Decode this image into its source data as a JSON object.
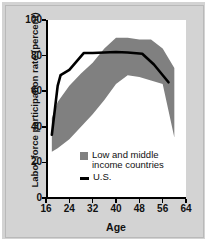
{
  "chart_data": {
    "type": "area",
    "title": "",
    "xlabel": "Age",
    "ylabel": "Labor force participation rate (percent)",
    "xlim": [
      16,
      64
    ],
    "ylim": [
      0,
      100
    ],
    "xticks": [
      16,
      24,
      32,
      40,
      48,
      56,
      64
    ],
    "yticks": [
      0,
      20,
      40,
      60,
      80,
      100
    ],
    "grid": false,
    "legend_position": "inside-lower-center",
    "series": [
      {
        "name": "Low and middle income countries",
        "type": "band",
        "color": "#808080",
        "x": [
          18,
          20,
          24,
          28,
          32,
          36,
          40,
          44,
          48,
          52,
          56,
          60
        ],
        "upper": [
          45,
          54,
          63,
          70,
          76,
          84,
          90,
          90,
          89,
          89,
          84,
          73
        ],
        "lower": [
          26,
          28,
          33,
          40,
          47,
          55,
          64,
          69,
          68,
          66,
          64,
          34
        ]
      },
      {
        "name": "U.S.",
        "type": "line",
        "color": "#000000",
        "x": [
          18,
          20,
          21,
          24,
          29,
          32,
          40,
          44,
          49,
          53,
          58
        ],
        "y": [
          35.5,
          63,
          69,
          72,
          81.5,
          81.5,
          82,
          81.7,
          81,
          75,
          65
        ]
      }
    ],
    "legend": [
      {
        "label": "Low and middle income countries",
        "marker": "square",
        "color": "#808080"
      },
      {
        "label": "U.S.",
        "marker": "line",
        "color": "#000000"
      }
    ]
  },
  "colors": {
    "background": "#d3d3d3",
    "plot_background": "#ffffff",
    "band": "#808080",
    "line": "#000000",
    "axis": "#000000"
  },
  "axis": {
    "y_tick_labels": [
      "100",
      "80",
      "60",
      "40",
      "20",
      "0"
    ],
    "x_tick_labels": [
      "16",
      "24",
      "32",
      "40",
      "48",
      "56",
      "64"
    ],
    "y_title": "Labor force participation rate (percent)",
    "x_title": "Age"
  },
  "legend_labels": {
    "band_line1": "Low and middle",
    "band_line2": "income countries",
    "us": "U.S."
  }
}
